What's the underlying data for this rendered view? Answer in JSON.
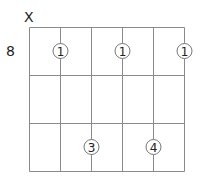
{
  "diagram": {
    "type": "guitar-chord-diagram",
    "base_fret_label": "8",
    "strings": 6,
    "frets_shown": 3,
    "string_markers": [
      {
        "string": 1,
        "marker": "X"
      }
    ],
    "fingers": [
      {
        "string": 2,
        "fret": 1,
        "finger": "1"
      },
      {
        "string": 4,
        "fret": 1,
        "finger": "1"
      },
      {
        "string": 6,
        "fret": 1,
        "finger": "1"
      },
      {
        "string": 3,
        "fret": 3,
        "finger": "3"
      },
      {
        "string": 5,
        "fret": 3,
        "finger": "4"
      }
    ],
    "colors": {
      "grid": "#8a8a8a",
      "text": "#222222",
      "dot_fill": "#ffffff"
    }
  }
}
